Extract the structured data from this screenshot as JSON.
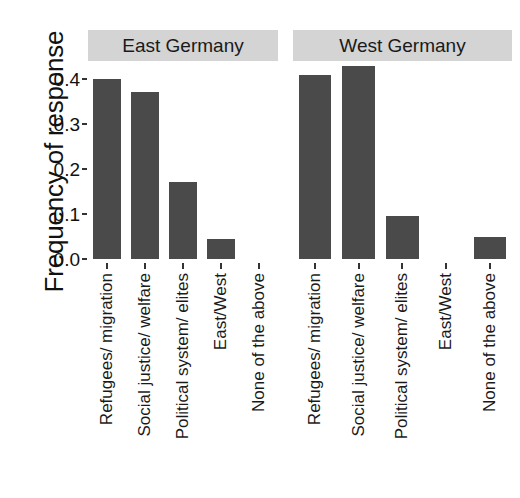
{
  "chart_data": {
    "type": "bar",
    "title": "",
    "subtitle": "",
    "xlabel": "",
    "ylabel": "Frequency of response",
    "ylim": [
      0.0,
      0.44
    ],
    "yticks": [
      "0.0",
      "0.1",
      "0.2",
      "0.3",
      "0.4"
    ],
    "ytick_values": [
      0.0,
      0.1,
      0.2,
      0.3,
      0.4
    ],
    "grid": false,
    "legend": "none",
    "bar_color": "#4a4a4a",
    "strip_color": "#d4d4d4",
    "categories": [
      "Refugees/ migration",
      "Social justice/ welfare",
      "Political system/ elites",
      "East/West",
      "None of the above"
    ],
    "panels": [
      {
        "label": "East Germany",
        "values": [
          0.4,
          0.372,
          0.172,
          0.045,
          0.0
        ]
      },
      {
        "label": "West Germany",
        "values": [
          0.409,
          0.428,
          0.096,
          0.0,
          0.05
        ]
      }
    ]
  }
}
